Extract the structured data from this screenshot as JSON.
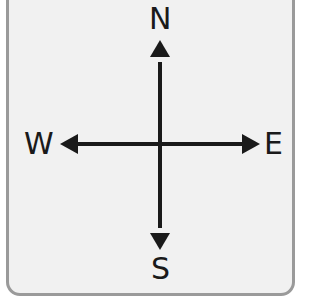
{
  "compass": {
    "north": "N",
    "south": "S",
    "east": "E",
    "west": "W"
  },
  "colors": {
    "background": "#f1f1f1",
    "border": "#9a9a9a",
    "arrows": "#1a1a1a"
  }
}
